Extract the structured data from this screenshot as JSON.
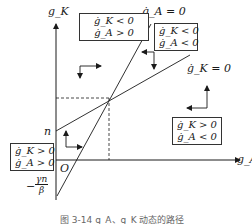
{
  "diagram": {
    "axes": {
      "y_label": "g_K",
      "x_label": "g_A",
      "origin_label": "O",
      "y_intercept_gK": "n",
      "y_intercept_gA_minus": "−",
      "y_intercept_gA_num": "γn",
      "y_intercept_gA_den": "β"
    },
    "lines": {
      "gA_null": "ġ_A = 0",
      "gK_null": "ġ_K = 0"
    },
    "regions": {
      "top_left": [
        "ġ_K < 0",
        "ġ_A > 0"
      ],
      "top_right": [
        "ġ_K < 0",
        "ġ_A < 0"
      ],
      "bottom_right": [
        "ġ_K > 0",
        "ġ_A < 0"
      ],
      "bottom_left": [
        "ġ_K > 0",
        "ġ_A > 0"
      ]
    },
    "caption": "图 3-14   g_A、g_K 动态的路径"
  },
  "colors": {
    "line": "#1a1a1a",
    "box_border": "#333333",
    "background": "#ffffff"
  }
}
